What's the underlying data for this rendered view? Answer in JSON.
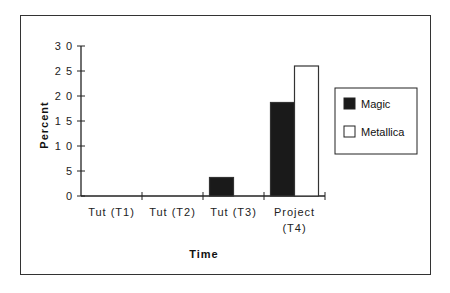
{
  "chart_data": {
    "type": "bar",
    "title": "",
    "xlabel": "Time",
    "ylabel": "Percent",
    "ylim": [
      0,
      30
    ],
    "yticks": [
      0,
      5,
      10,
      15,
      20,
      25,
      30
    ],
    "ytick_labels": [
      "0",
      "5",
      "1 0",
      "1 5",
      "2 0",
      "2 5",
      "3 0"
    ],
    "categories": [
      "Tut  (T1)",
      "Tut  (T2)",
      "Tut  (T3)",
      "Project (T4)"
    ],
    "category_lines": [
      [
        "Tut  (T1)"
      ],
      [
        "Tut  (T2)"
      ],
      [
        "Tut  (T3)"
      ],
      [
        "Project",
        "(T4)"
      ]
    ],
    "series": [
      {
        "name": "Magic",
        "color": "#1a1a1a",
        "values": [
          0,
          0,
          3.7,
          18.7
        ]
      },
      {
        "name": "Metallica",
        "color": "#ffffff",
        "values": [
          0,
          0,
          0,
          26
        ]
      }
    ],
    "legend_position": "right",
    "grid": false
  }
}
